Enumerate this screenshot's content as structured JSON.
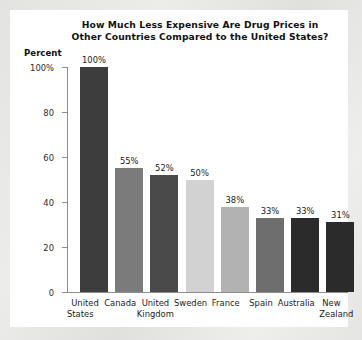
{
  "chart_data": {
    "type": "bar",
    "title": "How Much Less Expensive Are Drug Prices in Other Countries Compared to the United States?",
    "title_lines": [
      "How Much Less Expensive Are Drug Prices in",
      "Other Countries Compared to the United States?"
    ],
    "xlabel": "",
    "ylabel": "Percent",
    "ylim": [
      0,
      100
    ],
    "grid": false,
    "legend": "none",
    "y_ticks": [
      {
        "value": 100,
        "label": "100%"
      },
      {
        "value": 80,
        "label": "80"
      },
      {
        "value": 60,
        "label": "60"
      },
      {
        "value": 40,
        "label": "40"
      },
      {
        "value": 20,
        "label": "20"
      },
      {
        "value": 0,
        "label": "0"
      }
    ],
    "categories": [
      "United States",
      "Canada",
      "United Kingdom",
      "Sweden",
      "France",
      "Spain",
      "Australia",
      "New Zealand"
    ],
    "category_lines": [
      [
        "United",
        "States"
      ],
      [
        "Canada",
        ""
      ],
      [
        "United",
        "Kingdom"
      ],
      [
        "Sweden",
        ""
      ],
      [
        "France",
        ""
      ],
      [
        "Spain",
        ""
      ],
      [
        "Australia",
        ""
      ],
      [
        "New",
        "Zealand"
      ]
    ],
    "values": [
      100,
      55,
      52,
      50,
      38,
      33,
      33,
      31
    ],
    "value_labels": [
      "100%",
      "55%",
      "52%",
      "50%",
      "38%",
      "33%",
      "33%",
      "31%"
    ],
    "bar_colors": [
      "#3d3d3d",
      "#7b7b7b",
      "#4a4a4a",
      "#d2d2d2",
      "#b2b2b2",
      "#6e6e6e",
      "#2b2b2b",
      "#2b2b2b"
    ]
  },
  "colors": {
    "card_background": "#ffffff",
    "page_background": "#e8e8e6",
    "axis": "#8d8d8d",
    "text": "#1b1b1b"
  }
}
